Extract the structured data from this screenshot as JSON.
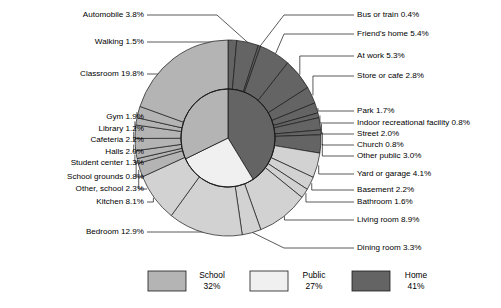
{
  "chart_data": {
    "type": "pie",
    "title": "",
    "subtitle": "",
    "xlabel": "",
    "ylabel": "",
    "legend_position": "bottom",
    "grid": false,
    "note": "Nested donut: inner ring = 3 category totals, outer ring = individual location segments",
    "categories": [
      "School",
      "Public",
      "Home"
    ],
    "category_values": [
      32,
      27,
      41
    ],
    "category_labels": [
      "32%",
      "27%",
      "41%"
    ],
    "category_colors": [
      "#b4b4b4",
      "#f0f0f0",
      "#646464"
    ],
    "series": [
      {
        "name": "School",
        "total": 32,
        "color": "#b4b4b4",
        "segments": [
          {
            "label": "Classroom 19.8%",
            "name": "Classroom",
            "value": 19.8
          },
          {
            "label": "Gym 1.9%",
            "name": "Gym",
            "value": 1.9
          },
          {
            "label": "Library 1.2%",
            "name": "Library",
            "value": 1.2
          },
          {
            "label": "Cafeteria 2.2%",
            "name": "Cafeteria",
            "value": 2.2
          },
          {
            "label": "Halls 2.0%",
            "name": "Halls",
            "value": 2.0
          },
          {
            "label": "Student center 1.3%",
            "name": "Student center",
            "value": 1.3
          },
          {
            "label": "School grounds 0.8%",
            "name": "School grounds",
            "value": 0.8
          },
          {
            "label": "Other, school 2.3%",
            "name": "Other, school",
            "value": 2.3
          }
        ]
      },
      {
        "name": "Public",
        "total": 27,
        "color": "#646464",
        "segments": [
          {
            "label": "Walking 1.5%",
            "name": "Walking",
            "value": 1.5
          },
          {
            "label": "Automobile 3.8%",
            "name": "Automobile",
            "value": 3.8
          },
          {
            "label": "Bus or train 0.4%",
            "name": "Bus or train",
            "value": 0.4
          },
          {
            "label": "Friend's home 5.4%",
            "name": "Friend's home",
            "value": 5.4
          },
          {
            "label": "At work 5.3%",
            "name": "At work",
            "value": 5.3
          },
          {
            "label": "Store or cafe 2.8%",
            "name": "Store or cafe",
            "value": 2.8
          },
          {
            "label": "Park 1.7%",
            "name": "Park",
            "value": 1.7
          },
          {
            "label": "Indoor recreational facility 0.8%",
            "name": "Indoor recreational facility",
            "value": 0.8
          },
          {
            "label": "Street 2.0%",
            "name": "Street",
            "value": 2.0
          },
          {
            "label": "Church 0.8%",
            "name": "Church",
            "value": 0.8
          },
          {
            "label": "Other public 3.0%",
            "name": "Other public",
            "value": 3.0
          }
        ]
      },
      {
        "name": "Home",
        "total": 41,
        "color": "#d2d2d2",
        "segments": [
          {
            "label": "Yard or garage 4.1%",
            "name": "Yard or garage",
            "value": 4.1
          },
          {
            "label": "Basement 2.2%",
            "name": "Basement",
            "value": 2.2
          },
          {
            "label": "Bathroom 1.6%",
            "name": "Bathroom",
            "value": 1.6
          },
          {
            "label": "Living room 8.9%",
            "name": "Living room",
            "value": 8.9
          },
          {
            "label": "Dining room 3.3%",
            "name": "Dining room",
            "value": 3.3
          },
          {
            "label": "Bedroom 12.9%",
            "name": "Bedroom",
            "value": 12.9
          },
          {
            "label": "Kitchen 8.1%",
            "name": "Kitchen",
            "value": 8.1
          }
        ]
      }
    ]
  },
  "labels_left": [
    {
      "id": "automobile",
      "text": "Automobile 3.8%",
      "x": 144,
      "y": 15
    },
    {
      "id": "walking",
      "text": "Walking 1.5%",
      "x": 144,
      "y": 42
    },
    {
      "id": "classroom",
      "text": "Classroom 19.8%",
      "x": 144,
      "y": 74
    },
    {
      "id": "gym",
      "text": "Gym 1.9%",
      "x": 144,
      "y": 117
    },
    {
      "id": "library",
      "text": "Library 1.2%",
      "x": 144,
      "y": 129
    },
    {
      "id": "cafeteria",
      "text": "Cafeteria 2.2%",
      "x": 144,
      "y": 140
    },
    {
      "id": "halls",
      "text": "Halls 2.0%",
      "x": 144,
      "y": 152
    },
    {
      "id": "student-center",
      "text": "Student center 1.3%",
      "x": 144,
      "y": 163
    },
    {
      "id": "school-grounds",
      "text": "School grounds 0.8%",
      "x": 144,
      "y": 177
    },
    {
      "id": "other-school",
      "text": "Other, school 2.3%",
      "x": 144,
      "y": 189
    },
    {
      "id": "kitchen",
      "text": "Kitchen 8.1%",
      "x": 144,
      "y": 202
    },
    {
      "id": "bedroom",
      "text": "Bedroom 12.9%",
      "x": 144,
      "y": 232
    }
  ],
  "labels_right": [
    {
      "id": "bus-or-train",
      "text": "Bus or train 0.4%",
      "x": 357,
      "y": 15
    },
    {
      "id": "friends-home",
      "text": "Friend's home 5.4%",
      "x": 357,
      "y": 34
    },
    {
      "id": "at-work",
      "text": "At work 5.3%",
      "x": 357,
      "y": 56
    },
    {
      "id": "store-or-cafe",
      "text": "Store or cafe 2.8%",
      "x": 357,
      "y": 76
    },
    {
      "id": "park",
      "text": "Park 1.7%",
      "x": 357,
      "y": 111
    },
    {
      "id": "indoor-rec",
      "text": "Indoor recreational facility 0.8%",
      "x": 357,
      "y": 123
    },
    {
      "id": "street",
      "text": "Street 2.0%",
      "x": 357,
      "y": 134
    },
    {
      "id": "church",
      "text": "Church 0.8%",
      "x": 357,
      "y": 145
    },
    {
      "id": "other-public",
      "text": "Other public 3.0%",
      "x": 357,
      "y": 156
    },
    {
      "id": "yard-or-garage",
      "text": "Yard or garage 4.1%",
      "x": 357,
      "y": 174
    },
    {
      "id": "basement",
      "text": "Basement 2.2%",
      "x": 357,
      "y": 190
    },
    {
      "id": "bathroom",
      "text": "Bathroom 1.6%",
      "x": 357,
      "y": 202
    },
    {
      "id": "living-room",
      "text": "Living room 8.9%",
      "x": 357,
      "y": 220
    },
    {
      "id": "dining-room",
      "text": "Dining room 3.3%",
      "x": 357,
      "y": 248
    }
  ],
  "legend": {
    "items": [
      {
        "id": "school",
        "name": "School",
        "value": "32%",
        "color": "#b4b4b4",
        "x": 148
      },
      {
        "id": "public",
        "name": "Public",
        "value": "27%",
        "color": "#f0f0f0",
        "x": 250
      },
      {
        "id": "home",
        "name": "Home",
        "value": "41%",
        "color": "#646464",
        "x": 352
      }
    ]
  }
}
